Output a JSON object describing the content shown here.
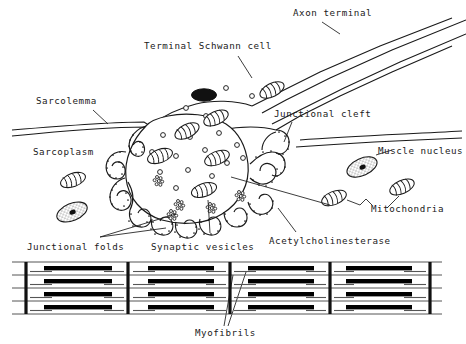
{
  "figure": {
    "width": 466,
    "height": 344,
    "background_color": "#ffffff",
    "ink_color": "#1a1a1a"
  },
  "labels": {
    "axon_terminal": "Axon terminal",
    "terminal_schwann_cell": "Terminal Schwann cell",
    "sarcolemma": "Sarcolemma",
    "sarcoplasm": "Sarcoplasm",
    "junctional_cleft": "Junctional cleft",
    "muscle_nucleus": "Muscle nucleus",
    "mitochondria": "Mitochondria",
    "junctional_folds": "Junctional folds",
    "synaptic_vesicles": "Synaptic vesicles",
    "acetylcholinesterase": "Acetylcholinesterase",
    "myofibrils": "Myofibrils"
  },
  "structures": {
    "schwann_nucleus": "solid-black-oval-nucleus",
    "muscle_nuclei_count": 2,
    "mitochondria_count": 8,
    "synaptic_vesicles_count": 17,
    "acetylcholine_clusters_count": 5,
    "junctional_fold_count": 11
  },
  "myofibril_band": {
    "z_lines": 5,
    "sarcomere_columns": 4,
    "myofibril_rows": 4,
    "a_band_color": "#000000",
    "thin_line_color": "#555555"
  }
}
